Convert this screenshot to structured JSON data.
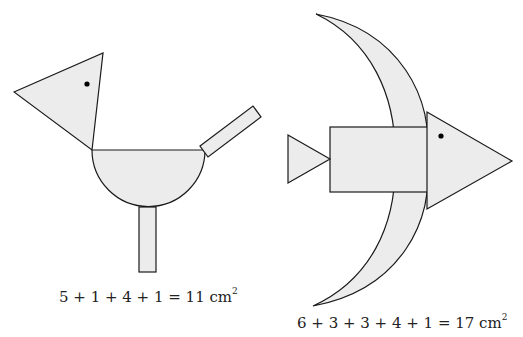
{
  "figures": [
    {
      "name": "bird",
      "parts": [
        "head-triangle",
        "body-semicircle",
        "tail-rectangle",
        "leg-rectangle"
      ],
      "caption": {
        "expression": "5 + 1 + 4 + 1 = 11 cm",
        "exponent": "2"
      }
    },
    {
      "name": "fish",
      "parts": [
        "crescent-fin",
        "body-rectangle",
        "head-triangle",
        "tail-triangle"
      ],
      "caption": {
        "expression": "6 + 3 + 3 + 4 + 1 = 17 cm",
        "exponent": "2"
      }
    }
  ],
  "colors": {
    "fill": "#ececec",
    "stroke": "#1a1a1a",
    "background": "#ffffff"
  }
}
